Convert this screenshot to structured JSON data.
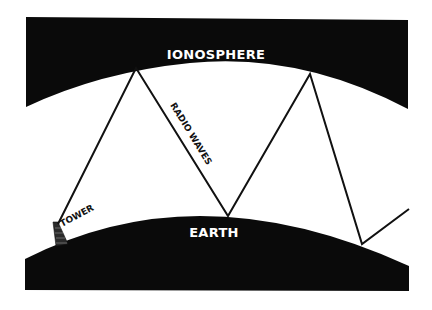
{
  "diagram": {
    "labels": {
      "ionosphere": "IONOSPHERE",
      "earth": "EARTH",
      "radio_waves": "RADIO WAVES",
      "tower": "TOWER"
    },
    "colors": {
      "background": "#ffffff",
      "fill": "#0a0a0a",
      "line": "#111111",
      "label_on_dark": "#ffffff",
      "label_on_light": "#111111"
    },
    "wave_path_points": [
      [
        58,
        224
      ],
      [
        136,
        68
      ],
      [
        228,
        216
      ],
      [
        310,
        74
      ],
      [
        362,
        244
      ],
      [
        409,
        209
      ]
    ]
  }
}
